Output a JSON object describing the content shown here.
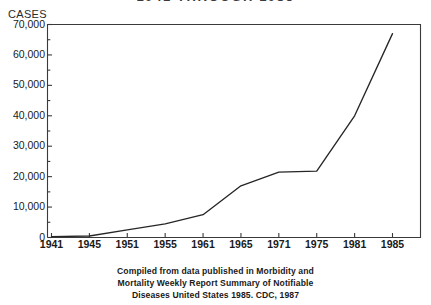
{
  "chart_data": {
    "type": "line",
    "title": "1941 THROUGH 1985",
    "title_clipped": true,
    "ylabel": "CASES",
    "xlabel": "",
    "categories": [
      "1941",
      "1945",
      "1951",
      "1955",
      "1961",
      "1965",
      "1971",
      "1975",
      "1981",
      "1985"
    ],
    "values": [
      300,
      500,
      2500,
      4500,
      7500,
      17000,
      21500,
      21800,
      40000,
      67000
    ],
    "series": [
      {
        "name": "Cases",
        "values": [
          300,
          500,
          2500,
          4500,
          7500,
          17000,
          21500,
          21800,
          40000,
          67000
        ]
      }
    ],
    "ylim": [
      0,
      70000
    ],
    "ytick_values": [
      0,
      10000,
      20000,
      30000,
      40000,
      50000,
      60000,
      70000
    ],
    "ytick_labels": [
      "0",
      "10,000",
      "20,000",
      "30,000",
      "40,000",
      "50,000",
      "60,000",
      "70,000"
    ],
    "yminor_step": 5000,
    "grid": false,
    "legend": false,
    "legend_position": "none",
    "line_color": "#262626",
    "frame_color": "#3a3a3a",
    "background_color": "#ffffff"
  },
  "caption": {
    "line1": "Compiled from data published in Morbidity and",
    "line2": "Mortality Weekly Report Summary of Notifiable",
    "line3": "Diseases United States 1985. CDC, 1987"
  }
}
